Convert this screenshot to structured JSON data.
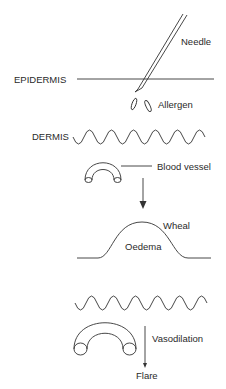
{
  "diagram": {
    "labels": {
      "needle": "Needle",
      "epidermis": "EPIDERMIS",
      "allergen": "Allergen",
      "dermis": "DERMIS",
      "blood_vessel": "Blood vessel",
      "wheal": "Wheal",
      "oedema": "Oedema",
      "vasodilation": "Vasodilation",
      "flare": "Flare"
    },
    "colors": {
      "stroke": "#333333",
      "text": "#2a2a2a",
      "background": "#ffffff"
    }
  }
}
